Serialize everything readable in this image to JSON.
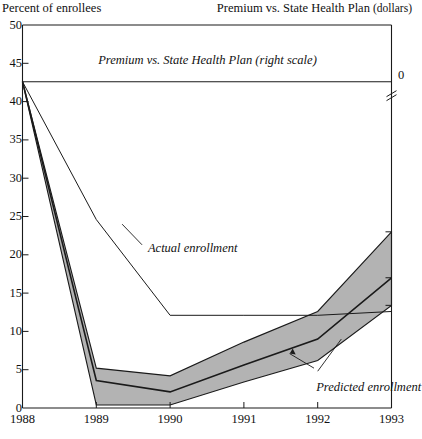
{
  "chart_data": {
    "type": "area",
    "title": "",
    "ylabel": "Percent of enrollees",
    "right_axis_label": "Premium vs. State Health Plan (dollars)",
    "right_axis_zero_label": "0",
    "xlabel": "",
    "x": [
      1988,
      1989,
      1990,
      1991,
      1992,
      1993
    ],
    "xlim": [
      1988,
      1993
    ],
    "ylim": [
      0,
      50
    ],
    "ytick_values": [
      0,
      5,
      10,
      15,
      20,
      25,
      30,
      35,
      40,
      45,
      50
    ],
    "ytick_labels": [
      "0",
      "5",
      "10",
      "15",
      "20",
      "25",
      "30",
      "35",
      "40",
      "45",
      "50"
    ],
    "xtick_labels": [
      "1988",
      "1989",
      "1990",
      "1991",
      "1992",
      "1993"
    ],
    "grid": false,
    "legend": "annotations",
    "annotations": [
      {
        "text": "Premium vs. State Health Plan  (right scale)",
        "x": 1990.0,
        "y": 45.3,
        "italic": true
      },
      {
        "text": "Actual enrollment",
        "x": 1989.85,
        "y": 20.6,
        "italic": true
      },
      {
        "text": "Predicted enrollment",
        "x": 1992.1,
        "y": 2.3,
        "italic": true
      }
    ],
    "series": [
      {
        "name": "Premium vs. State Health Plan (right scale)",
        "style": "line",
        "values": [
          42.6,
          42.6,
          42.6,
          42.6,
          42.6,
          42.6
        ]
      },
      {
        "name": "Actual enrollment",
        "style": "line",
        "values": [
          42.6,
          24.6,
          12.1,
          12.1,
          12.1,
          12.6
        ]
      },
      {
        "name": "Predicted enrollment",
        "style": "line",
        "values": [
          42.6,
          3.6,
          2.1,
          5.6,
          9.0,
          17.0
        ]
      },
      {
        "name": "Predicted enrollment upper bound",
        "style": "band-upper",
        "values": [
          42.6,
          5.2,
          4.2,
          8.6,
          12.6,
          23.0
        ]
      },
      {
        "name": "Predicted enrollment lower bound",
        "style": "band-lower",
        "values": [
          42.6,
          0.4,
          0.4,
          3.4,
          6.2,
          13.4
        ]
      }
    ]
  },
  "annotations": {
    "premium_line": "Premium vs. State Health Plan  (right scale)",
    "actual": "Actual enrollment",
    "predicted": "Predicted enrollment"
  },
  "axes": {
    "left_title": "Percent of enrollees",
    "right_title_main": "Premium vs. State Health Plan",
    "right_title_sub": "(dollars)",
    "right_zero": "0"
  }
}
